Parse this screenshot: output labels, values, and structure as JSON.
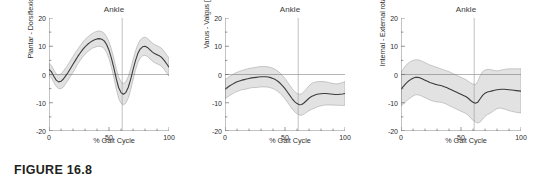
{
  "figure": {
    "caption": "FIGURE 16.8",
    "background_color": "#ffffff",
    "band_color": "#e2e2e2",
    "band_edge_color": "#9a9a9a",
    "mean_line_color": "#3c3c3c",
    "axis_color": "#6b6b6b",
    "event_line_color": "#9a9a9a"
  },
  "chart_data": [
    {
      "type": "line",
      "title": "Ankle",
      "xlabel": "% Gait Cycle",
      "ylabel": "Plantar - Dorsiflexion [°]",
      "xlim": [
        0,
        100
      ],
      "ylim": [
        -20,
        20
      ],
      "xticks": [
        0,
        50,
        100
      ],
      "xtick_labels": [
        "0",
        "50",
        "100"
      ],
      "xminor_step": 10,
      "yticks": [
        -20,
        -10,
        0,
        10,
        20
      ],
      "ytick_labels": [
        "-20",
        "-10",
        "0",
        "10",
        "20"
      ],
      "yminor_step": 5,
      "grid": false,
      "zero_line": true,
      "legend": "none",
      "annotations": [
        {
          "label": "toe-off",
          "type": "vline",
          "x": 61
        }
      ],
      "x": [
        0,
        2,
        4,
        6,
        8,
        10,
        12,
        14,
        16,
        18,
        20,
        22,
        24,
        26,
        28,
        30,
        32,
        34,
        36,
        38,
        40,
        42,
        44,
        46,
        48,
        50,
        52,
        54,
        56,
        58,
        60,
        62,
        64,
        66,
        68,
        70,
        72,
        74,
        76,
        78,
        80,
        82,
        84,
        86,
        88,
        90,
        92,
        94,
        96,
        98,
        100
      ],
      "series": [
        {
          "name": "mean",
          "values": [
            1.8,
            1.0,
            -0.6,
            -2.0,
            -2.6,
            -2.4,
            -1.6,
            -0.4,
            0.8,
            2.2,
            3.6,
            5.0,
            6.4,
            7.6,
            8.8,
            9.8,
            10.6,
            11.3,
            11.9,
            12.3,
            12.6,
            12.7,
            12.5,
            11.9,
            10.6,
            8.6,
            5.8,
            2.4,
            -1.4,
            -4.6,
            -6.4,
            -7.0,
            -6.4,
            -4.6,
            -1.8,
            1.6,
            4.8,
            7.4,
            9.0,
            9.8,
            10.0,
            9.6,
            8.8,
            8.0,
            7.4,
            7.0,
            6.6,
            6.0,
            5.0,
            3.8,
            2.6
          ]
        },
        {
          "name": "+1 SD",
          "values": [
            4.0,
            3.2,
            1.6,
            0.2,
            -0.2,
            0.2,
            1.2,
            2.4,
            3.6,
            5.0,
            6.4,
            7.8,
            9.0,
            10.2,
            11.4,
            12.4,
            13.2,
            13.9,
            14.5,
            15.0,
            15.3,
            15.4,
            15.2,
            14.6,
            13.4,
            11.6,
            9.0,
            5.8,
            2.2,
            -0.8,
            -2.6,
            -3.2,
            -2.6,
            -0.8,
            2.0,
            5.2,
            8.2,
            10.6,
            12.2,
            13.0,
            13.2,
            12.8,
            12.0,
            11.2,
            10.6,
            10.2,
            9.8,
            9.2,
            8.2,
            7.0,
            5.8
          ]
        },
        {
          "name": "-1 SD",
          "values": [
            -0.4,
            -1.2,
            -2.8,
            -4.2,
            -5.0,
            -5.0,
            -4.4,
            -3.2,
            -2.0,
            -0.6,
            0.8,
            2.2,
            3.8,
            5.0,
            6.2,
            7.2,
            8.0,
            8.7,
            9.3,
            9.6,
            9.9,
            10.0,
            9.8,
            9.2,
            7.8,
            5.6,
            2.6,
            -1.0,
            -5.0,
            -8.4,
            -10.2,
            -10.8,
            -10.2,
            -8.4,
            -5.6,
            -2.0,
            1.4,
            4.2,
            5.8,
            6.6,
            6.8,
            6.4,
            5.6,
            4.8,
            4.2,
            3.8,
            3.4,
            2.8,
            1.8,
            0.6,
            -0.6
          ]
        }
      ]
    },
    {
      "type": "line",
      "title": "Ankle",
      "xlabel": "% Gait Cycle",
      "ylabel": "Varus - Valgus [°]",
      "xlim": [
        0,
        100
      ],
      "ylim": [
        -20,
        20
      ],
      "xticks": [
        0,
        50,
        100
      ],
      "xtick_labels": [
        "0",
        "50",
        "100"
      ],
      "xminor_step": 10,
      "yticks": [
        -20,
        -10,
        0,
        10,
        20
      ],
      "ytick_labels": [
        "-20",
        "-10",
        "0",
        "10",
        "20"
      ],
      "yminor_step": 5,
      "grid": false,
      "zero_line": true,
      "legend": "none",
      "annotations": [
        {
          "label": "toe-off",
          "type": "vline",
          "x": 61
        }
      ],
      "x": [
        0,
        2,
        4,
        6,
        8,
        10,
        12,
        14,
        16,
        18,
        20,
        22,
        24,
        26,
        28,
        30,
        32,
        34,
        36,
        38,
        40,
        42,
        44,
        46,
        48,
        50,
        52,
        54,
        56,
        58,
        60,
        62,
        64,
        66,
        68,
        70,
        72,
        74,
        76,
        78,
        80,
        82,
        84,
        86,
        88,
        90,
        92,
        94,
        96,
        98,
        100
      ],
      "series": [
        {
          "name": "mean",
          "values": [
            -5.2,
            -4.6,
            -4.0,
            -3.5,
            -3.0,
            -2.6,
            -2.3,
            -2.0,
            -1.8,
            -1.6,
            -1.4,
            -1.2,
            -1.1,
            -1.0,
            -0.9,
            -0.8,
            -0.8,
            -0.8,
            -0.9,
            -1.1,
            -1.4,
            -1.8,
            -2.4,
            -3.1,
            -4.0,
            -5.0,
            -6.2,
            -7.4,
            -8.6,
            -9.6,
            -10.3,
            -10.7,
            -10.6,
            -10.0,
            -9.2,
            -8.4,
            -7.8,
            -7.4,
            -7.1,
            -6.9,
            -6.8,
            -6.7,
            -6.7,
            -6.8,
            -6.9,
            -7.0,
            -7.1,
            -7.1,
            -7.0,
            -6.9,
            -6.7
          ]
        },
        {
          "name": "+1 SD",
          "values": [
            -1.8,
            -1.2,
            -0.6,
            -0.1,
            0.4,
            0.8,
            1.1,
            1.4,
            1.7,
            1.9,
            2.1,
            2.3,
            2.4,
            2.6,
            2.7,
            2.8,
            2.8,
            2.8,
            2.7,
            2.5,
            2.2,
            1.8,
            1.2,
            0.5,
            -0.4,
            -1.4,
            -2.6,
            -3.8,
            -5.0,
            -6.0,
            -6.7,
            -7.0,
            -6.8,
            -6.0,
            -5.0,
            -4.0,
            -3.2,
            -2.8,
            -2.6,
            -2.5,
            -2.5,
            -2.5,
            -2.6,
            -2.8,
            -3.0,
            -3.2,
            -3.3,
            -3.3,
            -3.1,
            -2.8,
            -2.5
          ]
        },
        {
          "name": "-1 SD",
          "values": [
            -8.6,
            -8.0,
            -7.4,
            -6.9,
            -6.4,
            -6.0,
            -5.7,
            -5.4,
            -5.3,
            -5.1,
            -4.9,
            -4.7,
            -4.6,
            -4.6,
            -4.5,
            -4.4,
            -4.4,
            -4.4,
            -4.5,
            -4.7,
            -5.0,
            -5.4,
            -6.0,
            -6.7,
            -7.6,
            -8.6,
            -9.8,
            -11.0,
            -12.2,
            -13.2,
            -13.9,
            -14.4,
            -14.4,
            -14.0,
            -13.4,
            -12.8,
            -12.4,
            -12.0,
            -11.6,
            -11.3,
            -11.1,
            -10.9,
            -10.8,
            -10.8,
            -10.8,
            -10.8,
            -10.9,
            -10.9,
            -10.9,
            -11.0,
            -10.9
          ]
        }
      ]
    },
    {
      "type": "line",
      "title": "Ankle",
      "xlabel": "% Gait Cycle",
      "ylabel": "Internal - External rotation [°]",
      "xlim": [
        0,
        100
      ],
      "ylim": [
        -20,
        20
      ],
      "xticks": [
        0,
        50,
        100
      ],
      "xtick_labels": [
        "0",
        "50",
        "100"
      ],
      "xminor_step": 10,
      "yticks": [
        -20,
        -10,
        0,
        10,
        20
      ],
      "ytick_labels": [
        "-20",
        "-10",
        "0",
        "10",
        "20"
      ],
      "yminor_step": 5,
      "grid": false,
      "zero_line": true,
      "legend": "none",
      "annotations": [
        {
          "label": "toe-off",
          "type": "vline",
          "x": 61
        }
      ],
      "x": [
        0,
        2,
        4,
        6,
        8,
        10,
        12,
        14,
        16,
        18,
        20,
        22,
        24,
        26,
        28,
        30,
        32,
        34,
        36,
        38,
        40,
        42,
        44,
        46,
        48,
        50,
        52,
        54,
        56,
        58,
        60,
        62,
        64,
        66,
        68,
        70,
        72,
        74,
        76,
        78,
        80,
        82,
        84,
        86,
        88,
        90,
        92,
        94,
        96,
        98,
        100
      ],
      "series": [
        {
          "name": "mean",
          "values": [
            -5.2,
            -4.2,
            -3.2,
            -2.4,
            -1.8,
            -1.3,
            -1.0,
            -1.0,
            -1.2,
            -1.6,
            -2.0,
            -2.4,
            -2.8,
            -3.1,
            -3.4,
            -3.6,
            -3.8,
            -4.0,
            -4.3,
            -4.6,
            -5.0,
            -5.4,
            -5.8,
            -6.2,
            -6.6,
            -7.0,
            -7.4,
            -7.8,
            -8.4,
            -9.2,
            -9.8,
            -10.2,
            -9.8,
            -8.6,
            -7.4,
            -6.6,
            -6.2,
            -6.0,
            -5.8,
            -5.6,
            -5.4,
            -5.3,
            -5.2,
            -5.2,
            -5.3,
            -5.4,
            -5.5,
            -5.6,
            -5.7,
            -5.8,
            -5.9
          ]
        },
        {
          "name": "+1 SD",
          "values": [
            0.8,
            2.0,
            3.2,
            4.0,
            4.6,
            5.0,
            5.2,
            5.2,
            5.0,
            4.6,
            4.2,
            3.8,
            3.4,
            3.1,
            2.8,
            2.5,
            2.2,
            1.9,
            1.6,
            1.3,
            1.0,
            0.6,
            0.2,
            -0.2,
            -0.6,
            -1.0,
            -1.4,
            -1.8,
            -2.4,
            -3.0,
            -3.4,
            -3.6,
            -2.4,
            -0.4,
            1.0,
            1.6,
            1.8,
            1.8,
            1.6,
            1.4,
            1.3,
            1.4,
            1.6,
            1.8,
            1.9,
            2.0,
            2.0,
            2.0,
            2.0,
            2.0,
            2.0
          ]
        },
        {
          "name": "-1 SD",
          "values": [
            -11.2,
            -10.4,
            -9.6,
            -8.8,
            -8.2,
            -7.6,
            -7.2,
            -7.2,
            -7.4,
            -7.8,
            -8.2,
            -8.6,
            -9.0,
            -9.3,
            -9.6,
            -9.7,
            -9.8,
            -9.9,
            -10.2,
            -10.5,
            -11.0,
            -11.4,
            -11.8,
            -12.2,
            -12.6,
            -13.0,
            -13.4,
            -13.8,
            -14.4,
            -15.4,
            -16.2,
            -16.8,
            -17.2,
            -16.8,
            -15.8,
            -14.8,
            -14.2,
            -13.8,
            -13.2,
            -12.6,
            -12.1,
            -11.9,
            -12.0,
            -12.2,
            -12.5,
            -12.8,
            -13.0,
            -13.2,
            -13.4,
            -13.5,
            -13.6
          ]
        }
      ]
    }
  ]
}
